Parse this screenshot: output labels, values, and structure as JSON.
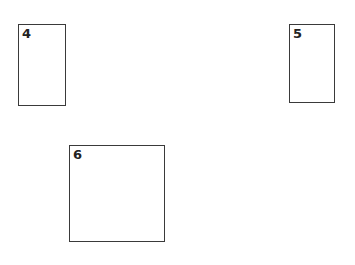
{
  "boxes": [
    {
      "id": "box-4",
      "label": "4",
      "x": 18,
      "y": 24,
      "w": 48,
      "h": 82
    },
    {
      "id": "box-5",
      "label": "5",
      "x": 289,
      "y": 24,
      "w": 46,
      "h": 79
    },
    {
      "id": "box-6",
      "label": "6",
      "x": 69,
      "y": 145,
      "w": 96,
      "h": 97
    }
  ]
}
